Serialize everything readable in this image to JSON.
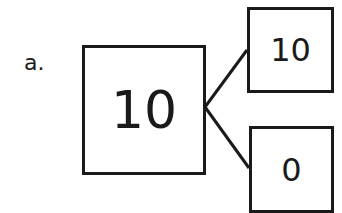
{
  "problem": {
    "label": "a.",
    "whole": "10",
    "parts": [
      "10",
      "0"
    ]
  },
  "colors": {
    "stroke": "#1a1a1a",
    "background": "#ffffff"
  }
}
